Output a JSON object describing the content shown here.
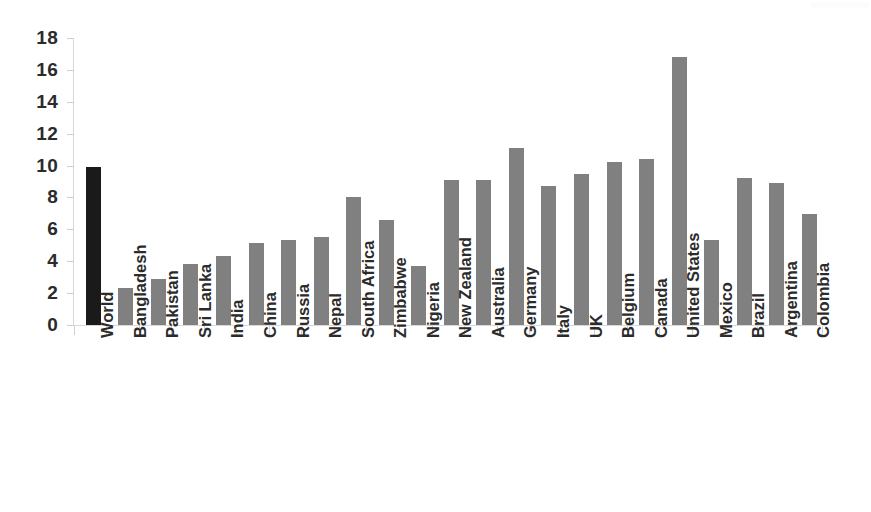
{
  "chart_data": {
    "type": "bar",
    "title": "",
    "subtitle": "",
    "xlabel": "",
    "ylabel": "",
    "ylim": [
      0,
      18
    ],
    "ytick_step": 2,
    "yticks": [
      18,
      16,
      14,
      12,
      10,
      8,
      6,
      4,
      2,
      0
    ],
    "grid": false,
    "legend": null,
    "categories": [
      "World",
      "Bangladesh",
      "Pakistan",
      "Sri Lanka",
      "India",
      "China",
      "Russia",
      "Nepal",
      "South Africa",
      "Zimbabwe",
      "Nigeria",
      "New Zealand",
      "Australia",
      "Germany",
      "Italy",
      "UK",
      "Belgium",
      "Canada",
      "United States",
      "Mexico",
      "Brazil",
      "Argentina",
      "Colombia"
    ],
    "values": [
      9.9,
      2.3,
      2.9,
      3.85,
      4.3,
      5.15,
      5.35,
      5.5,
      8.05,
      6.6,
      3.7,
      9.1,
      9.1,
      11.1,
      8.7,
      9.45,
      10.2,
      10.4,
      16.8,
      5.35,
      9.2,
      8.9,
      6.95
    ],
    "bar_colors": [
      "#1a1a1a",
      "#808080",
      "#808080",
      "#808080",
      "#808080",
      "#808080",
      "#808080",
      "#808080",
      "#808080",
      "#808080",
      "#808080",
      "#808080",
      "#808080",
      "#808080",
      "#808080",
      "#808080",
      "#808080",
      "#808080",
      "#808080",
      "#808080",
      "#808080",
      "#808080",
      "#808080"
    ],
    "highlight_category": "World",
    "highlight_color": "#1a1a1a",
    "series_color": "#808080",
    "axis_color": "#d9d9d9",
    "label_rotation_degrees": 90
  }
}
